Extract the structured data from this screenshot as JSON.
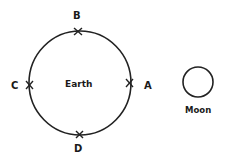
{
  "diagram": {
    "earth": {
      "label": "Earth",
      "cx": 80,
      "cy": 83,
      "rx": 51,
      "ry": 52
    },
    "moon": {
      "label": "Moon",
      "cx": 198,
      "cy": 82,
      "r": 15
    },
    "points": [
      {
        "id": "A",
        "label": "A"
      },
      {
        "id": "B",
        "label": "B"
      },
      {
        "id": "C",
        "label": "C"
      },
      {
        "id": "D",
        "label": "D"
      }
    ],
    "colors": {
      "stroke": "#222222",
      "background": "#ffffff"
    }
  }
}
